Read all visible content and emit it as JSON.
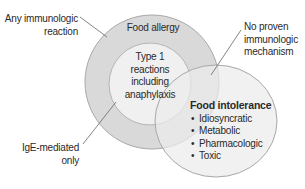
{
  "diagram": {
    "colors": {
      "outer_ring": "#d9d9d9",
      "inner_circle": "#f0f0f0",
      "intolerance_circle": "#ececec",
      "stroke": "#a8a8a8",
      "leader_line": "#666666",
      "text": "#2a2a2a"
    },
    "labels": {
      "any_immunologic_line1": "Any immunologic",
      "any_immunologic_line2": "reaction",
      "food_allergy": "Food allergy",
      "type1_line1": "Type 1",
      "type1_line2": "reactions",
      "type1_line3": "including",
      "type1_line4": "anaphylaxis",
      "no_proven_line1": "No proven",
      "no_proven_line2": "immunologic",
      "no_proven_line3": "mechanism",
      "ige_line1": "IgE-mediated",
      "ige_line2": "only"
    },
    "food_intolerance": {
      "title": "Food intolerance",
      "items": [
        "Idiosyncratic",
        "Metabolic",
        "Pharmacologic",
        "Toxic"
      ]
    }
  }
}
